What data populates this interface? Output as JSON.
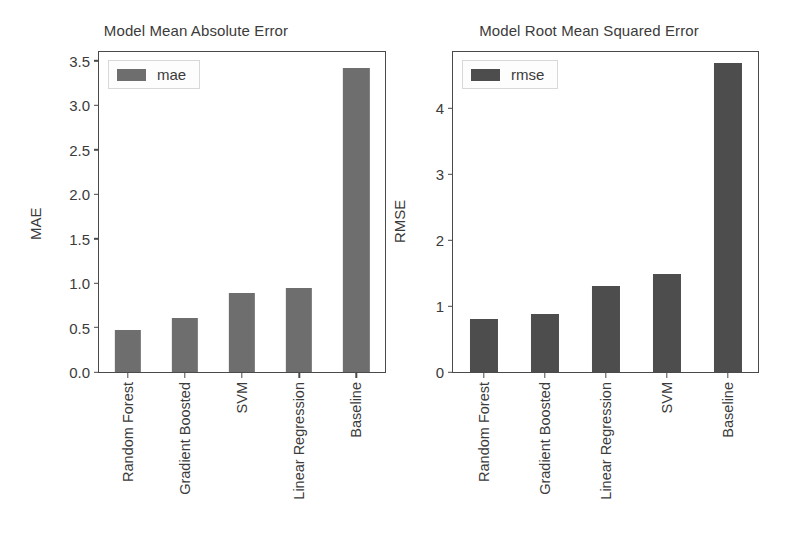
{
  "chart_data": [
    {
      "type": "bar",
      "title": "Model Mean Absolute Error",
      "xlabel": "",
      "ylabel": "MAE",
      "categories": [
        "Random Forest",
        "Gradient Boosted",
        "SVM",
        "Linear Regression",
        "Baseline"
      ],
      "values": [
        0.47,
        0.61,
        0.89,
        0.95,
        3.42
      ],
      "series": [
        {
          "name": "mae",
          "values": [
            0.47,
            0.61,
            0.89,
            0.95,
            3.42
          ]
        }
      ],
      "legend": [
        "mae"
      ],
      "legend_position": "upper left",
      "yticks": [
        "0.0",
        "0.5",
        "1.0",
        "1.5",
        "2.0",
        "2.5",
        "3.0",
        "3.5"
      ],
      "ytick_values": [
        0.0,
        0.5,
        1.0,
        1.5,
        2.0,
        2.5,
        3.0,
        3.5
      ],
      "ylim": [
        0.0,
        3.6
      ],
      "grid": false,
      "bar_color": "#6e6e6e"
    },
    {
      "type": "bar",
      "title": "Model Root Mean Squared Error",
      "xlabel": "",
      "ylabel": "RMSE",
      "categories": [
        "Random Forest",
        "Gradient Boosted",
        "Linear Regression",
        "SVM",
        "Baseline"
      ],
      "values": [
        0.81,
        0.88,
        1.31,
        1.48,
        4.68
      ],
      "series": [
        {
          "name": "rmse",
          "values": [
            0.81,
            0.88,
            1.31,
            1.48,
            4.68
          ]
        }
      ],
      "legend": [
        "rmse"
      ],
      "legend_position": "upper left",
      "yticks": [
        "0",
        "1",
        "2",
        "3",
        "4"
      ],
      "ytick_values": [
        0,
        1,
        2,
        3,
        4
      ],
      "ylim": [
        0,
        4.85
      ],
      "grid": false,
      "bar_color": "#4d4d4d"
    }
  ],
  "panels": [
    {
      "title": "Model Mean Absolute Error",
      "ylabel": "MAE",
      "legend_label": "mae"
    },
    {
      "title": "Model Root Mean Squared Error",
      "ylabel": "RMSE",
      "legend_label": "rmse"
    }
  ]
}
